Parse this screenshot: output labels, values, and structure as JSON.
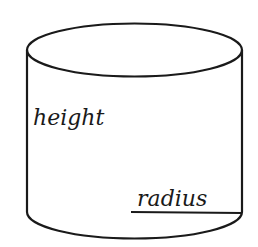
{
  "diagram": {
    "shape": "cylinder",
    "labels": {
      "height": "height",
      "radius": "radius"
    },
    "colors": {
      "stroke": "#1a1a1a",
      "background": "#ffffff"
    }
  }
}
